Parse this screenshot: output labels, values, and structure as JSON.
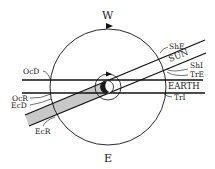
{
  "diagram": {
    "compass": {
      "top": "W",
      "bottom": "E"
    },
    "directions": {
      "sun": "SUN",
      "earth": "EARTH"
    },
    "events": {
      "ShE": "ShE",
      "ShI": "ShI",
      "TrE": "TrE",
      "TrI": "TrI",
      "OcD": "OcD",
      "OcR": "OcR",
      "EcD": "EcD",
      "EcR": "EcR"
    },
    "colors": {
      "line": "#111111",
      "shadow_band": "#c8c8c8",
      "planet_dark": "#1a1a1a",
      "background": "#ffffff"
    }
  }
}
